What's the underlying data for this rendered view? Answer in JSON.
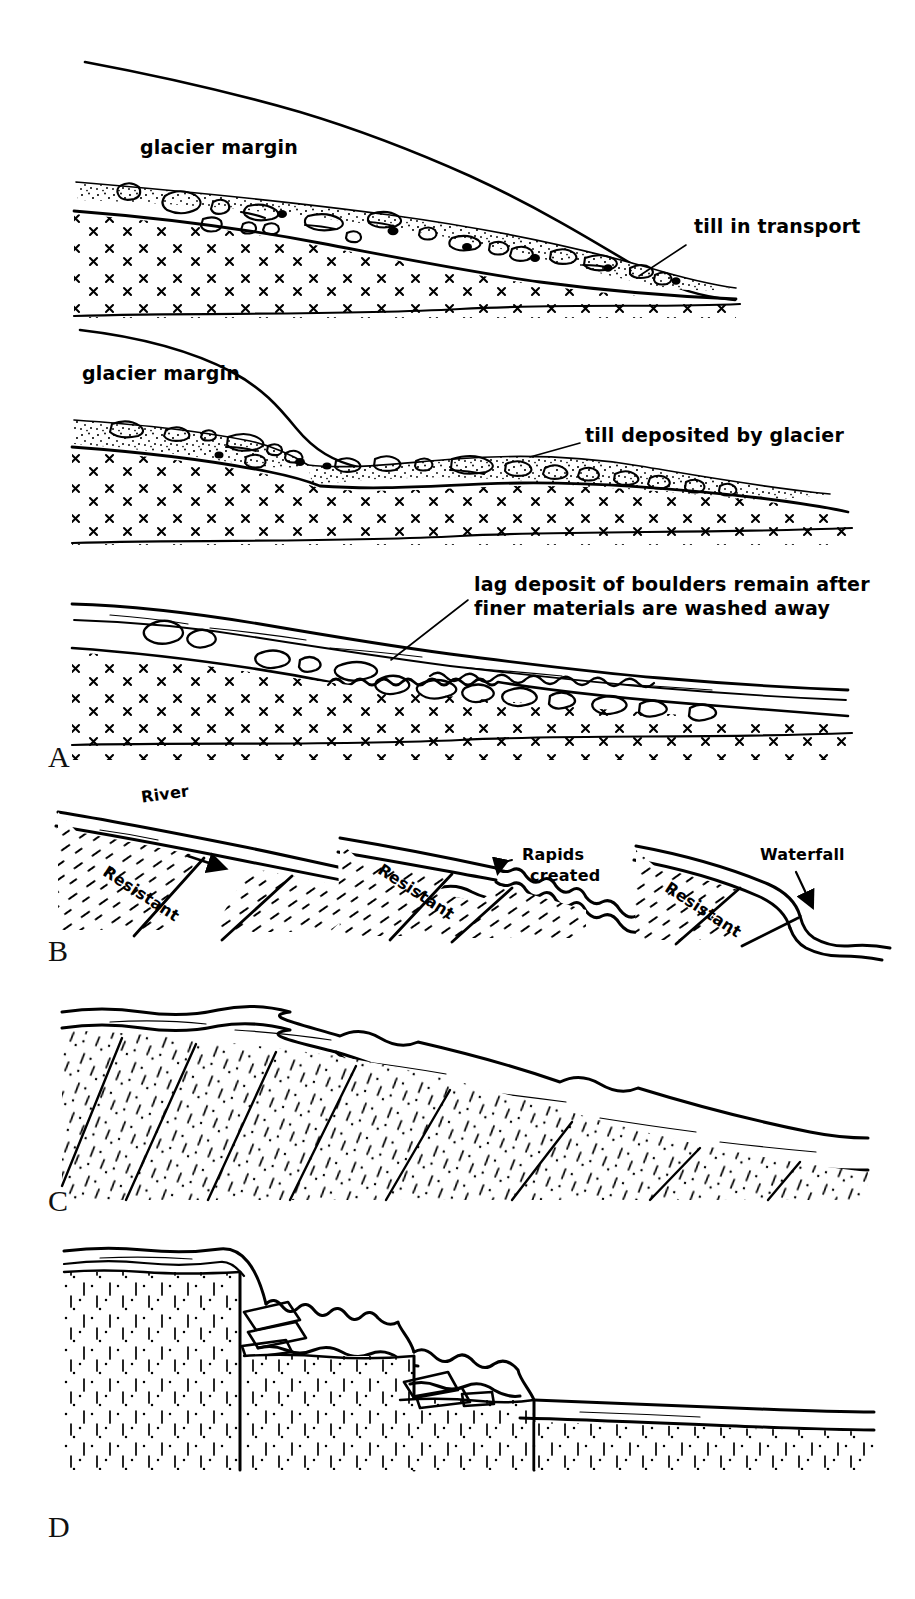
{
  "figure": {
    "background_color": "#ffffff",
    "ink_color": "#000000",
    "width": 915,
    "height": 1599
  },
  "panels": [
    {
      "letter": "A",
      "caption": "Glacial till transport, deposition and lag deposit",
      "subpanels": [
        {
          "index": 1,
          "labels": [
            {
              "name": "glacier-margin-label-1",
              "text": "glacier margin"
            },
            {
              "name": "till-in-transport-label",
              "text": "till in transport"
            }
          ]
        },
        {
          "index": 2,
          "labels": [
            {
              "name": "glacier-margin-label-2",
              "text": "glacier margin"
            },
            {
              "name": "till-deposited-label",
              "text": "till deposited by glacier"
            }
          ]
        },
        {
          "index": 3,
          "labels": [
            {
              "name": "lag-deposit-label",
              "text_line1": "lag deposit of boulders remain after",
              "text_line2": "finer materials are washed away"
            }
          ]
        }
      ]
    },
    {
      "letter": "B",
      "caption": "Resistant bed in river profile produces rapids then a waterfall",
      "scenes": [
        {
          "index": 1,
          "labels": [
            {
              "name": "river-label",
              "text": "River"
            },
            {
              "name": "resistant-label-1",
              "text": "Resistant"
            }
          ]
        },
        {
          "index": 2,
          "labels": [
            {
              "name": "rapids-label",
              "text_line1": "Rapids",
              "text_line2": "created"
            },
            {
              "name": "resistant-label-2",
              "text": "Resistant"
            }
          ]
        },
        {
          "index": 3,
          "labels": [
            {
              "name": "waterfall-label",
              "text": "Waterfall"
            },
            {
              "name": "resistant-label-3",
              "text": "Resistant"
            }
          ]
        }
      ]
    },
    {
      "letter": "C",
      "caption": "Stepped slope retreat along inclined joints in dipping strata",
      "labels": []
    },
    {
      "letter": "D",
      "caption": "Cliff retreat by rock fall along vertical joints",
      "labels": []
    }
  ],
  "labels_flat": {
    "glacier_margin_1": "glacier margin",
    "glacier_margin_2": "glacier margin",
    "till_in_transport": "till in transport",
    "till_deposited_by_glacier": "till deposited by glacier",
    "lag_deposit_line1": "lag deposit of boulders remain after",
    "lag_deposit_line2": "finer materials are washed away",
    "river": "River",
    "resistant_1": "Resistant",
    "resistant_2": "Resistant",
    "resistant_3": "Resistant",
    "rapids_line1": "Rapids",
    "rapids_line2": "created",
    "waterfall": "Waterfall",
    "letter_a": "A",
    "letter_b": "B",
    "letter_c": "C",
    "letter_d": "D"
  },
  "colors": {
    "ink": "#000000",
    "paper": "#ffffff"
  }
}
